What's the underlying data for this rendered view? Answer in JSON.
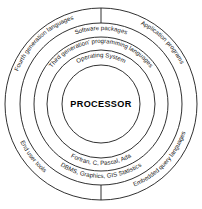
{
  "diagram": {
    "type": "concentric-ring-onion-diagram",
    "background_color": "#ffffff",
    "stroke_color": "#1a1a1a",
    "center": {
      "x": 101,
      "y": 104
    },
    "core": {
      "label": "PROCESSOR",
      "radius": 39
    },
    "circles": [
      {
        "name": "core-circle",
        "radius": 39
      },
      {
        "name": "operating-system-circle",
        "radius": 54
      },
      {
        "name": "third-generation-circle",
        "radius": 67
      },
      {
        "name": "software-packages-circle",
        "radius": 81
      },
      {
        "name": "outer-circle",
        "radius": 96
      }
    ],
    "top_labels": [
      {
        "id": "operating-system",
        "text": "Operating System",
        "ring_index": 1,
        "radius": 47,
        "position": "top"
      },
      {
        "id": "third-generation-programming-languages",
        "text": "Third generation' programming languages",
        "ring_index": 2,
        "radius": 61,
        "position": "top"
      },
      {
        "id": "software-packages",
        "text": "Software packages",
        "ring_index": 3,
        "radius": 74,
        "position": "top"
      },
      {
        "id": "fourth-generation-languages",
        "text": "Fourth generation languages",
        "ring_index": 4,
        "radius": 89,
        "position": "top-left"
      },
      {
        "id": "application-programs",
        "text": "Application programs",
        "ring_index": 4,
        "radius": 89,
        "position": "top-right"
      }
    ],
    "bottom_labels": [
      {
        "id": "fortran-c-pascal-ada",
        "text": "Fortran, C, Pascal, Ada",
        "ring_index": 2,
        "radius": 61,
        "position": "bottom"
      },
      {
        "id": "dbms-graphics-gis-statistics",
        "text": "DBMS, Graphics, GIS Statistics",
        "ring_index": 3,
        "radius": 74,
        "position": "bottom"
      },
      {
        "id": "end-user-tools",
        "text": "End user tools",
        "ring_index": 4,
        "radius": 89,
        "position": "bottom-left"
      },
      {
        "id": "embedded-query-languages",
        "text": "Embedded query languages",
        "ring_index": 4,
        "radius": 89,
        "position": "bottom-right"
      }
    ],
    "dividers": [
      {
        "id": "top-divider-tick",
        "position": "top",
        "from_radius": 81,
        "to_radius": 96
      },
      {
        "id": "bottom-divider-tick",
        "position": "bottom",
        "from_radius": 81,
        "to_radius": 96
      }
    ]
  }
}
